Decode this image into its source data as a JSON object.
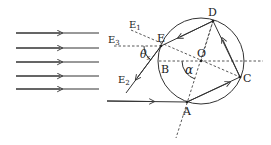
{
  "figure": {
    "type": "optics-ray-diagram",
    "incident_rays_count": 5,
    "colors": {
      "line": "#333333",
      "background": "#ffffff"
    }
  },
  "labels": {
    "D": "D",
    "E": "E",
    "E1": "E",
    "E1_sub": "1",
    "E2": "E",
    "E2_sub": "2",
    "E3": "E",
    "E3_sub": "3",
    "O": "O",
    "B": "B",
    "C": "C",
    "A": "A",
    "theta": "θ",
    "theta_sub": "s",
    "alpha": "α"
  }
}
